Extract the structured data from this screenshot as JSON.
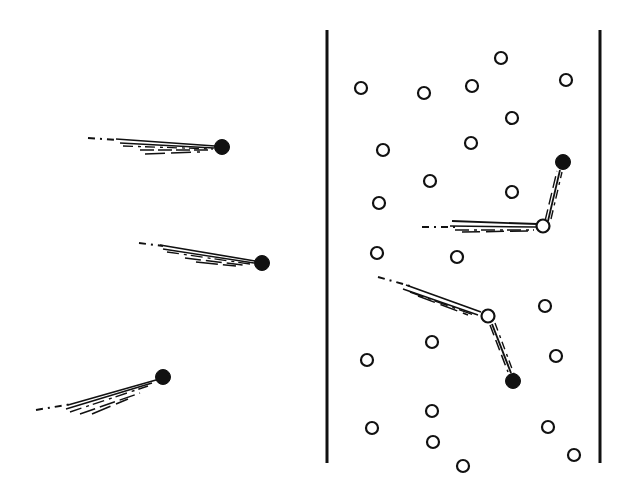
{
  "figure": {
    "title": "Particle trajectory bundles in free space and in a scattering medium",
    "width": 633,
    "height": 485,
    "background_color": "#ffffff",
    "ink_color": "#111111"
  },
  "chart_data": {
    "type": "scatter",
    "title": "Particle trajectory bundles in free space and in a scattering medium",
    "xlabel": "",
    "ylabel": "",
    "xlim": [
      0,
      633
    ],
    "ylim": [
      485,
      0
    ],
    "grid": false,
    "legend": "none",
    "coordinate_note": "All coordinates are in image pixel space, origin top-left.",
    "panels": [
      {
        "name": "left-panel",
        "label": "free-propagation",
        "description": "Three unscattered trajectory bundles, each a dashed incoming segment that fans into several near-parallel solid rays terminating at a filled detection dot.",
        "bounds": [
          0,
          0,
          320,
          485
        ],
        "boundary_lines": [],
        "scatterers": [],
        "endpoints": [
          {
            "id": "L1",
            "x": 222,
            "y": 147,
            "r": 7.5,
            "style": "filled"
          },
          {
            "id": "L2",
            "x": 262,
            "y": 263,
            "r": 7.5,
            "style": "filled"
          },
          {
            "id": "L3",
            "x": 163,
            "y": 377,
            "r": 7.5,
            "style": "filled"
          }
        ],
        "bundles": [
          {
            "id": "bundle-left-1",
            "endpoint": "L1",
            "dashed_lead": {
              "x1": 88,
              "y1": 138,
              "x2": 118,
              "y2": 140
            },
            "rays": [
              {
                "x1": 116,
                "y1": 139,
                "x2": 215,
                "y2": 146,
                "width": 1.6,
                "dash": "none"
              },
              {
                "x1": 120,
                "y1": 143,
                "x2": 214,
                "y2": 148,
                "width": 1.4,
                "dash": "none"
              },
              {
                "x1": 123,
                "y1": 146,
                "x2": 213,
                "y2": 149,
                "width": 1.3,
                "dash": "10 5 3 4"
              },
              {
                "x1": 140,
                "y1": 150,
                "x2": 212,
                "y2": 150,
                "width": 1.4,
                "dash": "14 4"
              },
              {
                "x1": 145,
                "y1": 154,
                "x2": 200,
                "y2": 152,
                "width": 1.5,
                "dash": "20 6"
              }
            ]
          },
          {
            "id": "bundle-left-2",
            "endpoint": "L2",
            "dashed_lead": {
              "x1": 139,
              "y1": 243,
              "x2": 163,
              "y2": 246
            },
            "rays": [
              {
                "x1": 160,
                "y1": 245,
                "x2": 255,
                "y2": 261,
                "width": 1.6,
                "dash": "none"
              },
              {
                "x1": 163,
                "y1": 249,
                "x2": 254,
                "y2": 263,
                "width": 1.4,
                "dash": "none"
              },
              {
                "x1": 167,
                "y1": 252,
                "x2": 250,
                "y2": 264,
                "width": 1.3,
                "dash": "12 5 3 4"
              },
              {
                "x1": 185,
                "y1": 258,
                "x2": 243,
                "y2": 265,
                "width": 1.5,
                "dash": "16 5"
              },
              {
                "x1": 196,
                "y1": 262,
                "x2": 236,
                "y2": 266,
                "width": 1.6,
                "dash": "22 5"
              }
            ]
          },
          {
            "id": "bundle-left-3",
            "endpoint": "L3",
            "dashed_lead": {
              "x1": 36,
              "y1": 410,
              "x2": 72,
              "y2": 404
            },
            "rays": [
              {
                "x1": 68,
                "y1": 405,
                "x2": 156,
                "y2": 380,
                "width": 1.6,
                "dash": "none"
              },
              {
                "x1": 66,
                "y1": 409,
                "x2": 152,
                "y2": 383,
                "width": 1.5,
                "dash": "none"
              },
              {
                "x1": 70,
                "y1": 412,
                "x2": 148,
                "y2": 386,
                "width": 1.4,
                "dash": "12 5 3 4"
              },
              {
                "x1": 80,
                "y1": 414,
                "x2": 140,
                "y2": 393,
                "width": 1.5,
                "dash": "16 5"
              },
              {
                "x1": 92,
                "y1": 414,
                "x2": 128,
                "y2": 399,
                "width": 1.6,
                "dash": "20 6"
              }
            ]
          }
        ]
      },
      {
        "name": "right-panel",
        "label": "scattering-medium",
        "description": "Same bundles entering a slab bounded by two vertical walls and filled with randomly placed open-circle scatterers; each bundle deflects at an open scatterer before reaching its filled detection dot.",
        "bounds": [
          320,
          0,
          313,
          485
        ],
        "boundary_lines": [
          {
            "id": "wall-left",
            "x1": 327,
            "y1": 30,
            "x2": 327,
            "y2": 463,
            "width": 3
          },
          {
            "id": "wall-right",
            "x1": 600,
            "y1": 30,
            "x2": 600,
            "y2": 463,
            "width": 3
          }
        ],
        "scatterers": [
          {
            "id": "S01",
            "x": 501,
            "y": 58,
            "r": 6
          },
          {
            "id": "S02",
            "x": 361,
            "y": 88,
            "r": 6
          },
          {
            "id": "S03",
            "x": 424,
            "y": 93,
            "r": 6
          },
          {
            "id": "S04",
            "x": 472,
            "y": 86,
            "r": 6
          },
          {
            "id": "S05",
            "x": 566,
            "y": 80,
            "r": 6
          },
          {
            "id": "S06",
            "x": 383,
            "y": 150,
            "r": 6
          },
          {
            "id": "S07",
            "x": 471,
            "y": 143,
            "r": 6
          },
          {
            "id": "S08",
            "x": 512,
            "y": 118,
            "r": 6
          },
          {
            "id": "S09",
            "x": 430,
            "y": 181,
            "r": 6
          },
          {
            "id": "S10",
            "x": 379,
            "y": 203,
            "r": 6
          },
          {
            "id": "S11",
            "x": 512,
            "y": 192,
            "r": 6
          },
          {
            "id": "S12",
            "x": 543,
            "y": 226,
            "r": 6.5,
            "role": "scattering-center-upper"
          },
          {
            "id": "S13",
            "x": 377,
            "y": 253,
            "r": 6
          },
          {
            "id": "S14",
            "x": 457,
            "y": 257,
            "r": 6
          },
          {
            "id": "S15",
            "x": 488,
            "y": 316,
            "r": 6.5,
            "role": "scattering-center-lower"
          },
          {
            "id": "S16",
            "x": 545,
            "y": 306,
            "r": 6
          },
          {
            "id": "S17",
            "x": 432,
            "y": 342,
            "r": 6
          },
          {
            "id": "S18",
            "x": 367,
            "y": 360,
            "r": 6
          },
          {
            "id": "S19",
            "x": 556,
            "y": 356,
            "r": 6
          },
          {
            "id": "S20",
            "x": 432,
            "y": 411,
            "r": 6
          },
          {
            "id": "S21",
            "x": 372,
            "y": 428,
            "r": 6
          },
          {
            "id": "S22",
            "x": 548,
            "y": 427,
            "r": 6
          },
          {
            "id": "S23",
            "x": 433,
            "y": 442,
            "r": 6
          },
          {
            "id": "S24",
            "x": 463,
            "y": 466,
            "r": 6
          },
          {
            "id": "S25",
            "x": 574,
            "y": 455,
            "r": 6
          }
        ],
        "endpoints": [
          {
            "id": "R1",
            "x": 563,
            "y": 162,
            "r": 7.5,
            "style": "filled"
          },
          {
            "id": "R2",
            "x": 513,
            "y": 381,
            "r": 7.5,
            "style": "filled"
          }
        ],
        "bundles": [
          {
            "id": "bundle-right-upper",
            "endpoint": "R1",
            "scatter_at": "S12",
            "incoming_dashed_lead": {
              "x1": 422,
              "y1": 227,
              "x2": 455,
              "y2": 227
            },
            "incoming_rays": [
              {
                "x1": 452,
                "y1": 221,
                "x2": 537,
                "y2": 224,
                "width": 1.8,
                "dash": "none"
              },
              {
                "x1": 450,
                "y1": 226,
                "x2": 536,
                "y2": 227,
                "width": 1.5,
                "dash": "none"
              },
              {
                "x1": 455,
                "y1": 230,
                "x2": 534,
                "y2": 230,
                "width": 1.4,
                "dash": "14 5 3 4"
              },
              {
                "x1": 462,
                "y1": 232,
                "x2": 528,
                "y2": 231,
                "width": 1.5,
                "dash": "18 6"
              }
            ],
            "outgoing_rays": [
              {
                "x1": 548,
                "y1": 221,
                "x2": 560,
                "y2": 170,
                "width": 1.8,
                "dash": "none"
              },
              {
                "x1": 545,
                "y1": 221,
                "x2": 557,
                "y2": 171,
                "width": 1.4,
                "dash": "12 5"
              },
              {
                "x1": 551,
                "y1": 219,
                "x2": 562,
                "y2": 172,
                "width": 1.4,
                "dash": "9 5 3 4"
              }
            ]
          },
          {
            "id": "bundle-right-lower",
            "endpoint": "R2",
            "scatter_at": "S15",
            "incoming_dashed_lead": {
              "x1": 378,
              "y1": 277,
              "x2": 410,
              "y2": 286
            },
            "incoming_rays": [
              {
                "x1": 406,
                "y1": 285,
                "x2": 481,
                "y2": 312,
                "width": 1.8,
                "dash": "none"
              },
              {
                "x1": 403,
                "y1": 289,
                "x2": 478,
                "y2": 315,
                "width": 1.5,
                "dash": "none"
              },
              {
                "x1": 410,
                "y1": 292,
                "x2": 474,
                "y2": 315,
                "width": 1.4,
                "dash": "14 5 3 4"
              },
              {
                "x1": 418,
                "y1": 296,
                "x2": 468,
                "y2": 315,
                "width": 1.5,
                "dash": "18 6"
              }
            ],
            "outgoing_rays": [
              {
                "x1": 492,
                "y1": 324,
                "x2": 511,
                "y2": 373,
                "width": 1.9,
                "dash": "none"
              },
              {
                "x1": 490,
                "y1": 325,
                "x2": 508,
                "y2": 372,
                "width": 1.5,
                "dash": "11 5"
              },
              {
                "x1": 495,
                "y1": 323,
                "x2": 514,
                "y2": 374,
                "width": 1.4,
                "dash": "8 5 3 4"
              }
            ]
          }
        ]
      }
    ]
  }
}
